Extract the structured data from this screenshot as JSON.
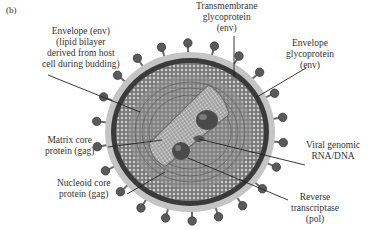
{
  "panel_label": "(b)",
  "colors": {
    "envelope_outer": "#bdbdbd",
    "envelope_ring": "#3a3a3a",
    "matrix": "#8a8a8a",
    "core": "#6e6e6e",
    "spike_head": "#5a5a5a",
    "leader_line": "#222222"
  },
  "labels": {
    "envelope_env": [
      "Envelope (env)",
      "(lipid bilayer",
      "derived from host",
      "cell during budding)"
    ],
    "transmembrane": [
      "Transmembrane",
      "glycoprotein",
      "(env)"
    ],
    "envelope_glyco": [
      "Envelope",
      "glycoprotein",
      "(env)"
    ],
    "matrix_core": [
      "Matrix core",
      "protein (gag)"
    ],
    "nucleoid_core": [
      "Nucleoid core",
      "protein (gag)"
    ],
    "viral_genomic": [
      "Viral genomic",
      "RNA/DNA"
    ],
    "reverse_transcriptase": [
      "Reverse",
      "transcriptase",
      "(pol)"
    ]
  }
}
